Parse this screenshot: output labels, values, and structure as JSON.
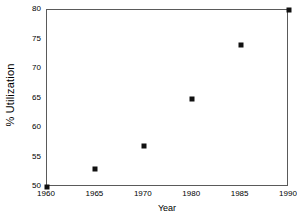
{
  "chart_data": {
    "type": "scatter",
    "title": "",
    "xlabel": "Year",
    "ylabel": "% Utilization",
    "categories": [
      "1960",
      "1965",
      "1970",
      "1980",
      "1985",
      "1990"
    ],
    "x_tick_labels": [
      "1960",
      "1965",
      "1970",
      "1980",
      "1985",
      "1990"
    ],
    "y_tick_labels": [
      "50",
      "55",
      "60",
      "65",
      "70",
      "75",
      "80"
    ],
    "y_ticks": [
      50,
      55,
      60,
      65,
      70,
      75,
      80
    ],
    "ylim": [
      50,
      80
    ],
    "grid": false,
    "legend": null,
    "marker": "square",
    "marker_color": "#111111",
    "axis_color": "#5a5a5a",
    "background_color": "#ffffff",
    "points": [
      {
        "x_label": "1960",
        "x_index": 0,
        "y": 50
      },
      {
        "x_label": "1965",
        "x_index": 1,
        "y": 53
      },
      {
        "x_label": "1970",
        "x_index": 2,
        "y": 57
      },
      {
        "x_label": "1980",
        "x_index": 3,
        "y": 65
      },
      {
        "x_label": "1985",
        "x_index": 4,
        "y": 74
      },
      {
        "x_label": "1990",
        "x_index": 5,
        "y": 80
      }
    ],
    "values": [
      50,
      53,
      57,
      65,
      74,
      80
    ]
  }
}
